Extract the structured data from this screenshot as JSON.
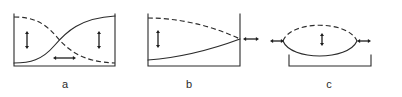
{
  "figure": {
    "kind": "scientific-line-diagram",
    "width": 402,
    "height": 97,
    "background_color": "#ffffff",
    "ink_color": "#2b2b2b",
    "panel_count": 3
  },
  "panels": [
    {
      "id": "a",
      "label": "a",
      "label_x": 65,
      "label_y": 88,
      "frame": {
        "x": 14,
        "y": 14,
        "width": 101,
        "height": 52
      },
      "frame_style": "left-and-right-verticals-plus-bottom-baseline",
      "curves": [
        {
          "name": "rising-solid-sigmoid",
          "style": "solid",
          "description": "S-shaped curve rising from bottom-left to top-right",
          "path": "M 14 63 C 30 63, 42 60, 54 46 C 66 32, 80 18, 115 16"
        },
        {
          "name": "falling-dashed-sigmoid",
          "style": "dashed",
          "description": "S-shaped curve falling from top-left to bottom-right",
          "path": "M 14 17 C 32 17, 44 22, 56 36 C 68 50, 82 62, 115 63"
        }
      ],
      "arrows": [
        {
          "name": "left-gap-arrow",
          "orientation": "vertical",
          "heads": "double",
          "x": 27,
          "y1": 31,
          "y2": 49
        },
        {
          "name": "right-gap-arrow",
          "orientation": "vertical",
          "heads": "double",
          "x": 99,
          "y1": 31,
          "y2": 49
        },
        {
          "name": "center-gap-arrow",
          "orientation": "horizontal",
          "heads": "double",
          "y": 58,
          "x1": 53,
          "x2": 76
        }
      ]
    },
    {
      "id": "b",
      "label": "b",
      "label_x": 189,
      "label_y": 88,
      "frame": {
        "x": 148,
        "y": 14,
        "width": 92,
        "height": 52
      },
      "frame_style": "left-and-right-verticals-plus-bottom-baseline",
      "curves": [
        {
          "name": "rising-solid-curve",
          "style": "solid",
          "description": "Gently rising solid curve converging toward right",
          "path": "M 148 60 C 175 58, 205 52, 240 39"
        },
        {
          "name": "falling-dashed-curve",
          "style": "dashed",
          "description": "Gently falling dashed curve converging toward right",
          "path": "M 148 18 C 175 18, 208 24, 240 39"
        }
      ],
      "arrows": [
        {
          "name": "left-gap-arrow",
          "orientation": "vertical",
          "heads": "double",
          "x": 158,
          "y1": 30,
          "y2": 48
        },
        {
          "name": "right-convergence-arrow",
          "orientation": "horizontal",
          "heads": "double",
          "y": 39,
          "x1": 243,
          "x2": 259
        }
      ]
    },
    {
      "id": "c",
      "label": "c",
      "label_x": 329,
      "label_y": 88,
      "frame": {
        "x": 289,
        "y": 55,
        "width": 82,
        "height": 11
      },
      "frame_style": "bottom-bracket-upward-tick-ends",
      "curves": [
        {
          "name": "lower-solid-arc",
          "style": "solid",
          "description": "Downward-bowing solid arc forming the lower half of a lens/ellipse",
          "path": "M 283 41 C 291 61, 348 61, 357 41"
        },
        {
          "name": "upper-dashed-arc",
          "style": "dashed",
          "description": "Upward-bowing dashed arc forming the upper half of a lens/ellipse",
          "path": "M 283 41 C 291 20, 348 20, 357 41"
        }
      ],
      "arrows": [
        {
          "name": "left-outward-arrow",
          "orientation": "horizontal",
          "heads": "double",
          "y": 41,
          "x1": 270,
          "x2": 284
        },
        {
          "name": "center-gap-arrow",
          "orientation": "vertical",
          "heads": "double",
          "x": 322,
          "y1": 33,
          "y2": 46
        },
        {
          "name": "right-outward-arrow",
          "orientation": "horizontal",
          "heads": "double",
          "y": 41,
          "x1": 357,
          "x2": 371
        }
      ]
    }
  ]
}
